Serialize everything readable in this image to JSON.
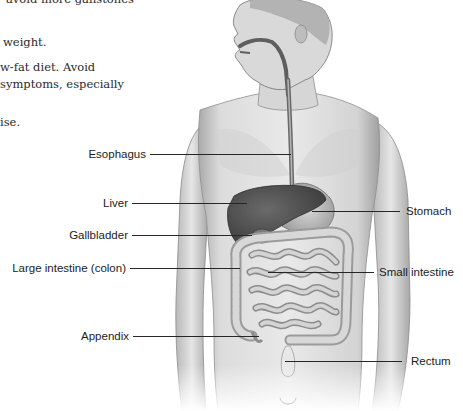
{
  "text_excerpt": {
    "lines": [
      "avoid more gallstones",
      "weight.",
      "w-fat diet. Avoid",
      "symptoms, especially",
      "ise."
    ]
  },
  "figure": {
    "labels": [
      {
        "id": "esophagus",
        "text": "Esophagus"
      },
      {
        "id": "liver",
        "text": "Liver"
      },
      {
        "id": "gallbladder",
        "text": "Gallbladder"
      },
      {
        "id": "large-intestine",
        "text": "Large intestine (colon)"
      },
      {
        "id": "appendix",
        "text": "Appendix"
      },
      {
        "id": "stomach",
        "text": "Stomach"
      },
      {
        "id": "small-intestine",
        "text": "Small intestine"
      },
      {
        "id": "rectum",
        "text": "Rectum"
      }
    ]
  },
  "colors": {
    "text": "#2a2a2a",
    "label_text": "#1c1c1c",
    "leader_line": "#262626",
    "skin_light": "#e4e4e4",
    "skin_mid": "#bdbdbd",
    "liver": "#4a4a4a",
    "esophagus": "#5a5a5a"
  }
}
